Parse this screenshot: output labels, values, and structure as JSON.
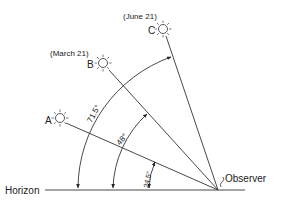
{
  "diagram": {
    "horizon_label": "Horizon",
    "observer_label": "Observer",
    "suns": [
      {
        "letter": "A",
        "date": "",
        "altitude": "24.5°"
      },
      {
        "letter": "B",
        "date": "(March 21)",
        "altitude": "48°"
      },
      {
        "letter": "C",
        "date": "(June 21)",
        "altitude": "71.5°"
      }
    ],
    "angle_labels": {
      "a": "24.5°",
      "b": "48°",
      "c": "71.5°"
    },
    "colors": {
      "line": "#333333",
      "text": "#222222",
      "background": "#ffffff"
    }
  }
}
